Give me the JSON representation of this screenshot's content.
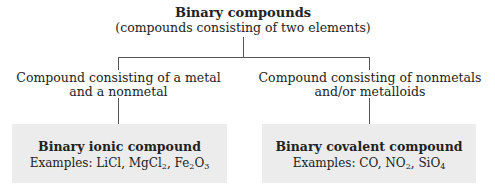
{
  "root": {
    "title": "Binary compounds",
    "subtitle": "(compounds consisting of two elements)"
  },
  "branches": [
    {
      "condition_line1": "Compound consisting of a metal",
      "condition_line2": "and a nonmetal",
      "result_title": "Binary ionic compound",
      "examples_label": "Examples:",
      "examples": [
        {
          "formula": "LiCl",
          "parts": [
            [
              "LiCl",
              ""
            ]
          ]
        },
        {
          "formula": "MgCl2",
          "parts": [
            [
              "MgCl",
              "2"
            ]
          ]
        },
        {
          "formula": "Fe2O3",
          "parts": [
            [
              "Fe",
              "2"
            ],
            [
              "O",
              "3"
            ]
          ]
        }
      ]
    },
    {
      "condition_line1": "Compound consisting of nonmetals",
      "condition_line2": "and/or metalloids",
      "result_title": "Binary covalent compound",
      "examples_label": "Examples:",
      "examples": [
        {
          "formula": "CO",
          "parts": [
            [
              "CO",
              ""
            ]
          ]
        },
        {
          "formula": "NO2",
          "parts": [
            [
              "NO",
              "2"
            ]
          ]
        },
        {
          "formula": "SiO4",
          "parts": [
            [
              "SiO",
              "4"
            ]
          ]
        }
      ]
    }
  ],
  "colors": {
    "box_fill": "#ececec",
    "line": "#555555",
    "text": "#222222"
  }
}
